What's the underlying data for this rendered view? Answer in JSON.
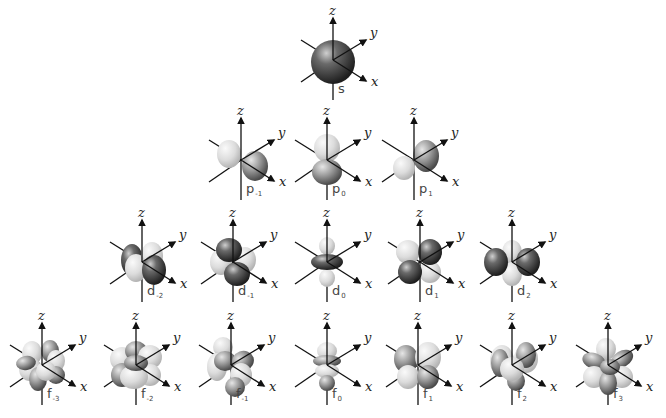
{
  "axes": {
    "x": "x",
    "y": "y",
    "z": "z"
  },
  "colors": {
    "dark_lobe": "#3a3a3a",
    "light_lobe": "#d8d8d8",
    "axis": "#111111",
    "label": "#444444"
  },
  "rows": [
    {
      "name": "s",
      "orbitals": [
        {
          "letter": "s",
          "sub": "",
          "cx": 333,
          "cy": 60
        }
      ]
    },
    {
      "name": "p",
      "orbitals": [
        {
          "letter": "p",
          "sub": "-1",
          "cx": 241,
          "cy": 160
        },
        {
          "letter": "p",
          "sub": "0",
          "cx": 327,
          "cy": 160
        },
        {
          "letter": "p",
          "sub": "1",
          "cx": 414,
          "cy": 160
        }
      ]
    },
    {
      "name": "d",
      "orbitals": [
        {
          "letter": "d",
          "sub": "-2",
          "cx": 142,
          "cy": 262
        },
        {
          "letter": "d",
          "sub": "-1",
          "cx": 233,
          "cy": 262
        },
        {
          "letter": "d",
          "sub": "0",
          "cx": 327,
          "cy": 262
        },
        {
          "letter": "d",
          "sub": "1",
          "cx": 420,
          "cy": 262
        },
        {
          "letter": "d",
          "sub": "2",
          "cx": 512,
          "cy": 262
        }
      ]
    },
    {
      "name": "f",
      "orbitals": [
        {
          "letter": "f",
          "sub": "-3",
          "cx": 42,
          "cy": 365
        },
        {
          "letter": "f",
          "sub": "-2",
          "cx": 136,
          "cy": 365
        },
        {
          "letter": "f",
          "sub": "-1",
          "cx": 231,
          "cy": 365
        },
        {
          "letter": "f",
          "sub": "0",
          "cx": 327,
          "cy": 365
        },
        {
          "letter": "f",
          "sub": "1",
          "cx": 418,
          "cy": 365
        },
        {
          "letter": "f",
          "sub": "2",
          "cx": 512,
          "cy": 365
        },
        {
          "letter": "f",
          "sub": "3",
          "cx": 608,
          "cy": 365
        }
      ]
    }
  ]
}
